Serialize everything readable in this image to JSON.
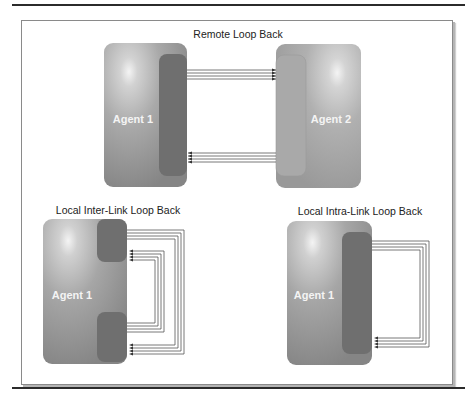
{
  "diagram": {
    "panels": [
      {
        "id": "remote",
        "title": "Remote Loop Back",
        "agents": [
          {
            "label": "Agent 1",
            "role": "transmitter"
          },
          {
            "label": "Agent 2",
            "role": "receiver"
          }
        ],
        "links": [
          {
            "from": "Agent 1",
            "to": "Agent 2",
            "lanes": 4
          },
          {
            "from": "Agent 2",
            "to": "Agent 1",
            "lanes": 4
          }
        ]
      },
      {
        "id": "inter",
        "title": "Local Inter-Link Loop Back",
        "agents": [
          {
            "label": "Agent 1"
          }
        ],
        "ports": 2,
        "links": [
          {
            "from": "port-top",
            "to": "port-bottom",
            "lanes": 4
          },
          {
            "from": "port-bottom",
            "to": "port-top",
            "lanes": 4
          }
        ]
      },
      {
        "id": "intra",
        "title": "Local Intra-Link Loop Back",
        "agents": [
          {
            "label": "Agent 1"
          }
        ],
        "ports": 1,
        "links": [
          {
            "from": "port-top",
            "to": "port-bottom",
            "lanes": 4
          }
        ]
      }
    ],
    "colors": {
      "agent_fill": "#9a9a9a",
      "agent_highlight": "#f2f2f2",
      "port_dark": "#6e6e6e",
      "port_light": "#a8a8a8",
      "wire": "#555555",
      "rule": "#2b2b2b"
    }
  }
}
